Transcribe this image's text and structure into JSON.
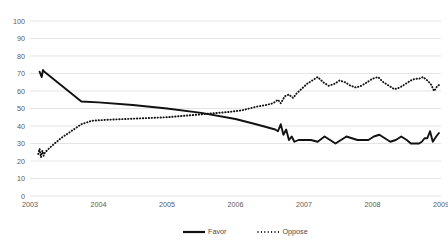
{
  "chart_data": {
    "type": "line",
    "title": "",
    "xlabel": "",
    "ylabel": "",
    "xlim": [
      2003.0,
      2009.0
    ],
    "ylim": [
      0,
      100
    ],
    "ytick_step": 10,
    "grid": true,
    "legend_position": "bottom-center",
    "x_tick_labels": [
      "2003",
      "2004",
      "2005",
      "2006",
      "2007",
      "2008",
      "2009"
    ],
    "x_ticks": [
      2003,
      2004,
      2005,
      2006,
      2007,
      2008,
      2009
    ],
    "y_tick_labels": [
      "0",
      "10",
      "20",
      "30",
      "40",
      "50",
      "60",
      "70",
      "80",
      "90",
      "100"
    ],
    "y_ticks": [
      0,
      10,
      20,
      30,
      40,
      50,
      60,
      70,
      80,
      90,
      100
    ],
    "series": [
      {
        "name": "Favor",
        "style": "solid",
        "color": "#111111",
        "points": [
          [
            2003.14,
            71
          ],
          [
            2003.17,
            68
          ],
          [
            2003.19,
            72
          ],
          [
            2003.21,
            71
          ],
          [
            2003.75,
            54
          ],
          [
            2004.0,
            53.5
          ],
          [
            2004.5,
            52
          ],
          [
            2005.0,
            50
          ],
          [
            2005.5,
            47.5
          ],
          [
            2006.0,
            44
          ],
          [
            2006.3,
            41
          ],
          [
            2006.58,
            38
          ],
          [
            2006.62,
            37
          ],
          [
            2006.66,
            41
          ],
          [
            2006.7,
            35
          ],
          [
            2006.74,
            38
          ],
          [
            2006.78,
            32
          ],
          [
            2006.82,
            34
          ],
          [
            2006.86,
            31
          ],
          [
            2006.92,
            32
          ],
          [
            2007.0,
            32
          ],
          [
            2007.1,
            32
          ],
          [
            2007.2,
            31
          ],
          [
            2007.3,
            34
          ],
          [
            2007.38,
            32
          ],
          [
            2007.46,
            30
          ],
          [
            2007.54,
            32
          ],
          [
            2007.62,
            34
          ],
          [
            2007.7,
            33
          ],
          [
            2007.78,
            32
          ],
          [
            2007.86,
            32
          ],
          [
            2007.94,
            32
          ],
          [
            2008.02,
            34
          ],
          [
            2008.1,
            35
          ],
          [
            2008.18,
            33
          ],
          [
            2008.26,
            31
          ],
          [
            2008.34,
            32
          ],
          [
            2008.42,
            34
          ],
          [
            2008.5,
            32
          ],
          [
            2008.56,
            30
          ],
          [
            2008.62,
            30
          ],
          [
            2008.68,
            30
          ],
          [
            2008.72,
            31
          ],
          [
            2008.76,
            33
          ],
          [
            2008.8,
            33
          ],
          [
            2008.84,
            37
          ],
          [
            2008.88,
            31
          ],
          [
            2008.93,
            34
          ],
          [
            2008.97,
            36
          ]
        ]
      },
      {
        "name": "Oppose",
        "style": "dotted",
        "color": "#111111",
        "points": [
          [
            2003.12,
            24
          ],
          [
            2003.14,
            27
          ],
          [
            2003.16,
            22
          ],
          [
            2003.18,
            26
          ],
          [
            2003.2,
            23
          ],
          [
            2003.22,
            25
          ],
          [
            2003.3,
            28
          ],
          [
            2003.45,
            33
          ],
          [
            2003.6,
            37
          ],
          [
            2003.75,
            41
          ],
          [
            2003.9,
            43
          ],
          [
            2004.1,
            43.5
          ],
          [
            2004.4,
            44
          ],
          [
            2004.7,
            44.5
          ],
          [
            2005.0,
            45
          ],
          [
            2005.3,
            46
          ],
          [
            2005.6,
            47
          ],
          [
            2005.9,
            48
          ],
          [
            2006.1,
            49
          ],
          [
            2006.3,
            51
          ],
          [
            2006.45,
            52
          ],
          [
            2006.55,
            53
          ],
          [
            2006.62,
            55
          ],
          [
            2006.66,
            53
          ],
          [
            2006.72,
            57
          ],
          [
            2006.78,
            58
          ],
          [
            2006.84,
            56
          ],
          [
            2006.9,
            59
          ],
          [
            2006.96,
            61
          ],
          [
            2007.04,
            64
          ],
          [
            2007.12,
            66
          ],
          [
            2007.2,
            68
          ],
          [
            2007.28,
            65
          ],
          [
            2007.36,
            63
          ],
          [
            2007.44,
            64
          ],
          [
            2007.52,
            66
          ],
          [
            2007.6,
            65
          ],
          [
            2007.68,
            63
          ],
          [
            2007.76,
            62
          ],
          [
            2007.84,
            63
          ],
          [
            2007.92,
            65
          ],
          [
            2008.0,
            67
          ],
          [
            2008.08,
            68
          ],
          [
            2008.16,
            65
          ],
          [
            2008.24,
            63
          ],
          [
            2008.32,
            61
          ],
          [
            2008.4,
            62
          ],
          [
            2008.48,
            64
          ],
          [
            2008.56,
            66
          ],
          [
            2008.62,
            67
          ],
          [
            2008.68,
            67
          ],
          [
            2008.74,
            68
          ],
          [
            2008.8,
            66
          ],
          [
            2008.85,
            64
          ],
          [
            2008.9,
            60
          ],
          [
            2008.95,
            63
          ],
          [
            2009.0,
            64
          ]
        ]
      }
    ],
    "legend": [
      {
        "label": "Favor",
        "style": "solid"
      },
      {
        "label": "Oppose",
        "style": "dotted"
      }
    ]
  }
}
